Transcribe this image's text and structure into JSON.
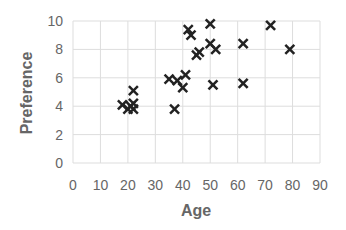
{
  "chart_data": {
    "type": "scatter",
    "title": "",
    "xlabel": "Age",
    "ylabel": "Preference",
    "xlim": [
      0,
      90
    ],
    "ylim": [
      0,
      10
    ],
    "xticks": [
      0,
      10,
      20,
      30,
      40,
      50,
      60,
      70,
      80,
      90
    ],
    "yticks": [
      0,
      2,
      4,
      6,
      8,
      10
    ],
    "grid": true,
    "legend": null,
    "marker": "x",
    "marker_color": "#222222",
    "series": [
      {
        "name": "Preference vs Age",
        "points": [
          {
            "x": 18,
            "y": 4.1
          },
          {
            "x": 20,
            "y": 3.8
          },
          {
            "x": 21,
            "y": 4.0
          },
          {
            "x": 22,
            "y": 3.8
          },
          {
            "x": 22,
            "y": 4.2
          },
          {
            "x": 22,
            "y": 5.1
          },
          {
            "x": 35,
            "y": 5.9
          },
          {
            "x": 37,
            "y": 3.8
          },
          {
            "x": 38,
            "y": 5.8
          },
          {
            "x": 40,
            "y": 5.3
          },
          {
            "x": 41,
            "y": 6.2
          },
          {
            "x": 42,
            "y": 9.4
          },
          {
            "x": 43,
            "y": 9.0
          },
          {
            "x": 45,
            "y": 7.6
          },
          {
            "x": 46,
            "y": 7.8
          },
          {
            "x": 50,
            "y": 9.8
          },
          {
            "x": 50,
            "y": 8.4
          },
          {
            "x": 51,
            "y": 5.5
          },
          {
            "x": 52,
            "y": 8.0
          },
          {
            "x": 62,
            "y": 8.4
          },
          {
            "x": 62,
            "y": 5.6
          },
          {
            "x": 72,
            "y": 9.7
          },
          {
            "x": 79,
            "y": 8.0
          }
        ]
      }
    ]
  }
}
